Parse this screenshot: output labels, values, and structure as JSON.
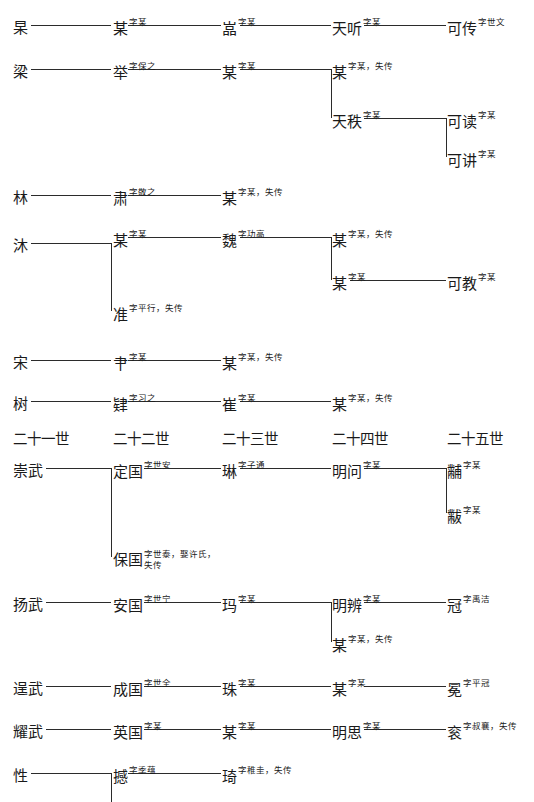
{
  "document": {
    "type": "genealogy-chart",
    "title": "族谱世系图"
  },
  "generation_headers": [
    {
      "label": "二十一世",
      "x": 13,
      "y": 432
    },
    {
      "label": "二十二世",
      "x": 113,
      "y": 432
    },
    {
      "label": "二十三世",
      "x": 222,
      "y": 432
    },
    {
      "label": "二十四世",
      "x": 332,
      "y": 432
    },
    {
      "label": "二十五世",
      "x": 447,
      "y": 432
    }
  ],
  "nodes": [
    {
      "id": "n1",
      "name": "杲",
      "ann": "",
      "x": 13,
      "y": 20
    },
    {
      "id": "n2",
      "name": "某",
      "ann": "字某",
      "x": 113,
      "y": 20
    },
    {
      "id": "n3",
      "name": "嵓",
      "ann": "字某",
      "x": 222,
      "y": 20
    },
    {
      "id": "n4",
      "name": "天听",
      "ann": "字某",
      "x": 332,
      "y": 20
    },
    {
      "id": "n5",
      "name": "可传",
      "ann": "字世文",
      "x": 447,
      "y": 20
    },
    {
      "id": "n6",
      "name": "梁",
      "ann": "",
      "x": 13,
      "y": 64
    },
    {
      "id": "n7",
      "name": "举",
      "ann": "字保之",
      "x": 113,
      "y": 64
    },
    {
      "id": "n8",
      "name": "某",
      "ann": "字某",
      "x": 222,
      "y": 64
    },
    {
      "id": "n9",
      "name": "某",
      "ann": "字某，失传",
      "x": 332,
      "y": 64
    },
    {
      "id": "n10",
      "name": "天秩",
      "ann": "字某",
      "x": 332,
      "y": 113
    },
    {
      "id": "n11",
      "name": "可读",
      "ann": "字某",
      "x": 447,
      "y": 113
    },
    {
      "id": "n12",
      "name": "可讲",
      "ann": "字某",
      "x": 447,
      "y": 152
    },
    {
      "id": "n13",
      "name": "林",
      "ann": "",
      "x": 13,
      "y": 190
    },
    {
      "id": "n14",
      "name": "肃",
      "ann": "字敬之",
      "x": 113,
      "y": 190
    },
    {
      "id": "n15",
      "name": "某",
      "ann": "字某，失传",
      "x": 222,
      "y": 190
    },
    {
      "id": "n16",
      "name": "沐",
      "ann": "",
      "x": 13,
      "y": 238
    },
    {
      "id": "n17",
      "name": "某",
      "ann": "字某",
      "x": 113,
      "y": 232
    },
    {
      "id": "n18",
      "name": "魏",
      "ann": "字功高",
      "x": 222,
      "y": 232
    },
    {
      "id": "n19",
      "name": "某",
      "ann": "字某，失传",
      "x": 332,
      "y": 232
    },
    {
      "id": "n20",
      "name": "某",
      "ann": "字某",
      "x": 332,
      "y": 275
    },
    {
      "id": "n21",
      "name": "可教",
      "ann": "字某",
      "x": 447,
      "y": 275
    },
    {
      "id": "n22",
      "name": "准",
      "ann": "字平行，失传",
      "x": 113,
      "y": 306
    },
    {
      "id": "n23",
      "name": "宋",
      "ann": "",
      "x": 13,
      "y": 355
    },
    {
      "id": "n24",
      "name": "肀",
      "ann": "字某",
      "x": 113,
      "y": 355
    },
    {
      "id": "n25",
      "name": "某",
      "ann": "字某，失传",
      "x": 222,
      "y": 355
    },
    {
      "id": "n26",
      "name": "树",
      "ann": "",
      "x": 13,
      "y": 396
    },
    {
      "id": "n27",
      "name": "肄",
      "ann": "字习之",
      "x": 113,
      "y": 396
    },
    {
      "id": "n28",
      "name": "崔",
      "ann": "字某",
      "x": 222,
      "y": 396
    },
    {
      "id": "n29",
      "name": "某",
      "ann": "字某，失传",
      "x": 332,
      "y": 396
    },
    {
      "id": "n30",
      "name": "崇武",
      "ann": "",
      "x": 13,
      "y": 463
    },
    {
      "id": "n31",
      "name": "定国",
      "ann": "字世安",
      "x": 113,
      "y": 463
    },
    {
      "id": "n32",
      "name": "琳",
      "ann": "字子通",
      "x": 222,
      "y": 463
    },
    {
      "id": "n33",
      "name": "明问",
      "ann": "字某",
      "x": 332,
      "y": 463
    },
    {
      "id": "n34",
      "name": "黼",
      "ann": "字某",
      "x": 447,
      "y": 463
    },
    {
      "id": "n35",
      "name": "黻",
      "ann": "字某",
      "x": 447,
      "y": 508
    },
    {
      "id": "n36",
      "name": "保国",
      "ann": "字世泰，娶许氏，失传",
      "x": 113,
      "y": 552,
      "wrap": true
    },
    {
      "id": "n37",
      "name": "扬武",
      "ann": "",
      "x": 13,
      "y": 597
    },
    {
      "id": "n38",
      "name": "安国",
      "ann": "字世宁",
      "x": 113,
      "y": 597
    },
    {
      "id": "n39",
      "name": "玛",
      "ann": "字某",
      "x": 222,
      "y": 597
    },
    {
      "id": "n40",
      "name": "明辨",
      "ann": "字某",
      "x": 332,
      "y": 597
    },
    {
      "id": "n41",
      "name": "冠",
      "ann": "字禹洁",
      "x": 447,
      "y": 597
    },
    {
      "id": "n42",
      "name": "某",
      "ann": "字某，失传",
      "x": 332,
      "y": 637
    },
    {
      "id": "n43",
      "name": "逞武",
      "ann": "",
      "x": 13,
      "y": 681
    },
    {
      "id": "n44",
      "name": "成国",
      "ann": "字世全",
      "x": 113,
      "y": 681
    },
    {
      "id": "n45",
      "name": "珠",
      "ann": "字某",
      "x": 222,
      "y": 681
    },
    {
      "id": "n46",
      "name": "某",
      "ann": "字某",
      "x": 332,
      "y": 681
    },
    {
      "id": "n47",
      "name": "冕",
      "ann": "字平冠",
      "x": 447,
      "y": 681
    },
    {
      "id": "n48",
      "name": "耀武",
      "ann": "",
      "x": 13,
      "y": 724
    },
    {
      "id": "n49",
      "name": "英国",
      "ann": "字某",
      "x": 113,
      "y": 724
    },
    {
      "id": "n50",
      "name": "某",
      "ann": "字某",
      "x": 222,
      "y": 724
    },
    {
      "id": "n51",
      "name": "明思",
      "ann": "字某",
      "x": 332,
      "y": 724
    },
    {
      "id": "n52",
      "name": "衮",
      "ann": "字叔襄，失传",
      "x": 447,
      "y": 724
    },
    {
      "id": "n53",
      "name": "性",
      "ann": "",
      "x": 13,
      "y": 768
    },
    {
      "id": "n54",
      "name": "撼",
      "ann": "字季蕴",
      "x": 113,
      "y": 768
    },
    {
      "id": "n55",
      "name": "琦",
      "ann": "字稚圭，失传",
      "x": 222,
      "y": 768
    }
  ],
  "connectors": {
    "horizontal": [
      {
        "x": 31,
        "y": 25,
        "w": 80
      },
      {
        "x": 128,
        "y": 25,
        "w": 93
      },
      {
        "x": 240,
        "y": 25,
        "w": 91
      },
      {
        "x": 364,
        "y": 25,
        "w": 82
      },
      {
        "x": 31,
        "y": 69,
        "w": 80
      },
      {
        "x": 128,
        "y": 69,
        "w": 93
      },
      {
        "x": 240,
        "y": 69,
        "w": 91
      },
      {
        "x": 364,
        "y": 118,
        "w": 82
      },
      {
        "x": 31,
        "y": 195,
        "w": 80
      },
      {
        "x": 128,
        "y": 195,
        "w": 93
      },
      {
        "x": 31,
        "y": 243,
        "w": 80
      },
      {
        "x": 128,
        "y": 237,
        "w": 93
      },
      {
        "x": 240,
        "y": 237,
        "w": 91
      },
      {
        "x": 350,
        "y": 280,
        "w": 96
      },
      {
        "x": 31,
        "y": 360,
        "w": 80
      },
      {
        "x": 128,
        "y": 360,
        "w": 93
      },
      {
        "x": 31,
        "y": 401,
        "w": 80
      },
      {
        "x": 128,
        "y": 401,
        "w": 93
      },
      {
        "x": 240,
        "y": 401,
        "w": 91
      },
      {
        "x": 46,
        "y": 468,
        "w": 65
      },
      {
        "x": 144,
        "y": 468,
        "w": 77
      },
      {
        "x": 240,
        "y": 468,
        "w": 91
      },
      {
        "x": 364,
        "y": 468,
        "w": 82
      },
      {
        "x": 46,
        "y": 602,
        "w": 65
      },
      {
        "x": 144,
        "y": 602,
        "w": 77
      },
      {
        "x": 240,
        "y": 602,
        "w": 91
      },
      {
        "x": 364,
        "y": 602,
        "w": 82
      },
      {
        "x": 46,
        "y": 686,
        "w": 65
      },
      {
        "x": 144,
        "y": 686,
        "w": 77
      },
      {
        "x": 240,
        "y": 686,
        "w": 91
      },
      {
        "x": 364,
        "y": 686,
        "w": 82
      },
      {
        "x": 46,
        "y": 729,
        "w": 65
      },
      {
        "x": 144,
        "y": 729,
        "w": 77
      },
      {
        "x": 240,
        "y": 729,
        "w": 91
      },
      {
        "x": 364,
        "y": 729,
        "w": 82
      },
      {
        "x": 31,
        "y": 773,
        "w": 80
      },
      {
        "x": 128,
        "y": 773,
        "w": 93
      }
    ],
    "vertical": [
      {
        "x": 331,
        "y": 69,
        "h": 49
      },
      {
        "x": 446,
        "y": 118,
        "h": 39
      },
      {
        "x": 111,
        "y": 243,
        "h": 68
      },
      {
        "x": 331,
        "y": 237,
        "h": 43
      },
      {
        "x": 111,
        "y": 468,
        "h": 89
      },
      {
        "x": 446,
        "y": 468,
        "h": 45
      },
      {
        "x": 331,
        "y": 602,
        "h": 40
      },
      {
        "x": 111,
        "y": 773,
        "h": 29
      }
    ]
  }
}
